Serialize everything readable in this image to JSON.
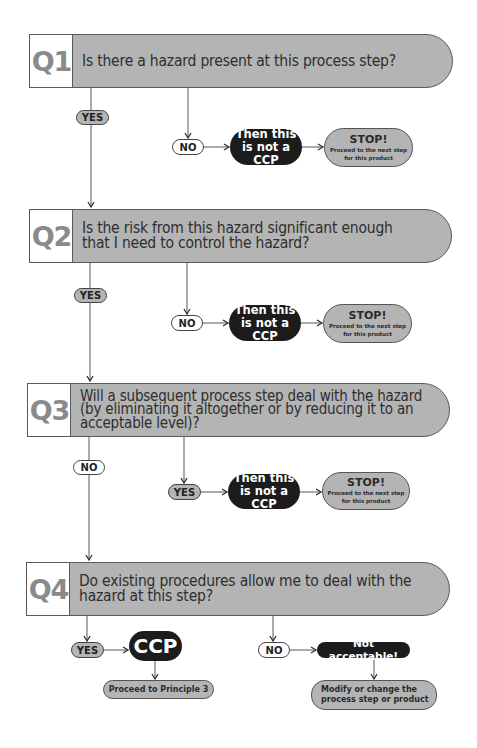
{
  "questions": [
    {
      "number": "Q1",
      "text": "Is there a hazard present at this process step?",
      "continue_label": "YES",
      "exit_label": "NO",
      "exit_result": "Then this\nis not a CCP",
      "stop_title": "STOP!",
      "stop_sub": "Proceed to the next step\nfor this product"
    },
    {
      "number": "Q2",
      "text": "Is the risk from this hazard significant enough\nthat I need to control the hazard?",
      "continue_label": "YES",
      "exit_label": "NO",
      "exit_result": "Then this\nis not a CCP",
      "stop_title": "STOP!",
      "stop_sub": "Proceed to the next step\nfor this product"
    },
    {
      "number": "Q3",
      "text": "Will a subsequent process step deal with the hazard\n(by eliminating it altogether or by reducing it to an\nacceptable level)?",
      "continue_label": "NO",
      "exit_label": "YES",
      "exit_result": "Then this\nis not a CCP",
      "stop_title": "STOP!",
      "stop_sub": "Proceed to the next step\nfor this product"
    },
    {
      "number": "Q4",
      "text": "Do existing procedures allow me to deal with the\nhazard at this step?",
      "yes_label": "YES",
      "yes_result": "CCP",
      "yes_next": "Proceed to Principle 3",
      "no_label": "NO",
      "no_result": "Not acceptable!",
      "no_next": "Modify or change the\nprocess step or product"
    }
  ],
  "colors": {
    "question_fill": "#b4b4b4",
    "question_number": "#8a8a8a",
    "dark_box": "#1c1c1c",
    "line": "#555555"
  }
}
